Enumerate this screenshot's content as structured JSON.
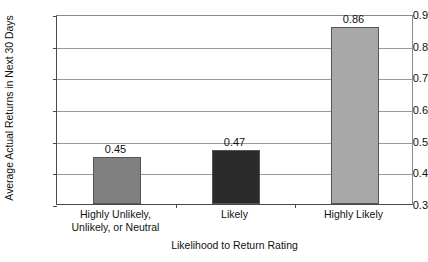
{
  "chart_data": {
    "type": "bar",
    "title": "",
    "xlabel": "Likelihood to Return Rating",
    "ylabel": "Average Actual Returns in Next 30 Days",
    "categories": [
      "Highly Unlikely,\nUnlikely, or Neutral",
      "Likely",
      "Highly Likely"
    ],
    "values": [
      0.45,
      0.47,
      0.86
    ],
    "value_labels": [
      "0.45",
      "0.47",
      "0.86"
    ],
    "bar_colors": [
      "#808080",
      "#2a2a2a",
      "#a8a8a8"
    ],
    "bar_edge_color": "#555555",
    "ylim": [
      0.3,
      0.9
    ],
    "yticks": [
      0.3,
      0.4,
      0.5,
      0.6,
      0.7,
      0.8,
      0.9
    ],
    "ytick_labels": [
      "0.3",
      "0.4",
      "0.5",
      "0.6",
      "0.7",
      "0.8",
      "0.9"
    ],
    "grid": true,
    "grid_color": "#9a9a9a",
    "legend": null,
    "legend_position": "none",
    "background_color": "#ffffff",
    "axis_color": "#4a4a4a"
  }
}
